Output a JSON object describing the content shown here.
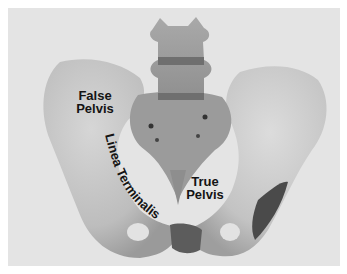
{
  "image": {
    "subject": "pelvis-anatomy-photo",
    "background_color": "#e4e4e4",
    "bone_color": "#c9c9c9",
    "labels": {
      "false_pelvis": [
        "False",
        "Pelvis"
      ],
      "true_pelvis": [
        "True",
        "Pelvis"
      ],
      "linea_terminalis": "Linea Terminalis"
    }
  }
}
